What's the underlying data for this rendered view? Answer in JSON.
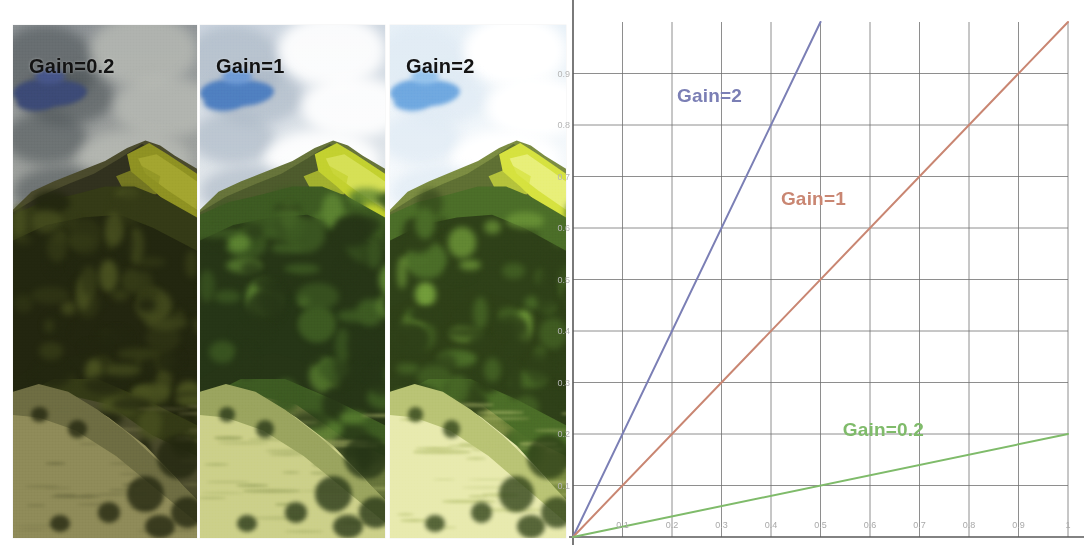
{
  "figure": {
    "background": "#ffffff"
  },
  "panels": [
    {
      "id": "gain-02",
      "label": "Gain=0.2",
      "gain": 0.2,
      "left": 13,
      "top": 25,
      "width": 184,
      "height": 513,
      "brightness": 0.36,
      "saturation": 0.72,
      "contrast": 0.95,
      "sky_top": "#8e9396",
      "sky_bottom": "#a9aba3",
      "cloud_color": "rgba(70,76,80,0.55)",
      "cloud_light": "rgba(186,188,182,0.75)",
      "blue_patch": "#3c4a76",
      "blue_patch_2": "#46558a",
      "ridge_dark": "#31311e",
      "ridge_mid": "#4a4a2c",
      "grass_highlight": "#8e9122",
      "grass_highlight_2": "#a3a52f",
      "forest_dark": "#22260f",
      "forest_mid": "#343a16",
      "forest_light": "#4a5220",
      "slope_top": "#6d6c42",
      "slope_bottom": "#8e8a58",
      "label_color": "#131313"
    },
    {
      "id": "gain-1",
      "label": "Gain=1",
      "gain": 1,
      "left": 200,
      "top": 25,
      "width": 185,
      "height": 513,
      "brightness": 1.0,
      "saturation": 1.0,
      "contrast": 1.0,
      "sky_top": "#cdd6e0",
      "sky_bottom": "#eef1f2",
      "cloud_color": "rgba(168,180,195,0.62)",
      "cloud_light": "rgba(255,255,255,0.9)",
      "blue_patch": "#4f7fc0",
      "blue_patch_2": "#6d9ad6",
      "ridge_dark": "#4d5a2c",
      "ridge_mid": "#66733a",
      "grass_highlight": "#c3d12f",
      "grass_highlight_2": "#d6e055",
      "forest_dark": "#263516",
      "forest_mid": "#3d5a22",
      "forest_light": "#5d8432",
      "slope_top": "#9aa45e",
      "slope_bottom": "#ccd089",
      "label_color": "#121212"
    },
    {
      "id": "gain-2",
      "label": "Gain=2",
      "gain": 2,
      "left": 390,
      "top": 25,
      "width": 176,
      "height": 513,
      "brightness": 1.45,
      "saturation": 1.08,
      "contrast": 1.02,
      "sky_top": "#e8f1f8",
      "sky_bottom": "#ffffff",
      "cloud_color": "rgba(222,234,244,0.7)",
      "cloud_light": "rgba(255,255,255,1)",
      "blue_patch": "#6fa8e0",
      "blue_patch_2": "#93c2ec",
      "ridge_dark": "#5e6f33",
      "ridge_mid": "#7b8c42",
      "grass_highlight": "#d6e23f",
      "grass_highlight_2": "#e8ef78",
      "forest_dark": "#2e4018",
      "forest_mid": "#4b6d28",
      "forest_light": "#75a13c",
      "slope_top": "#b9c374",
      "slope_bottom": "#e8eaae",
      "label_color": "#141414"
    }
  ],
  "chart_data": {
    "type": "line",
    "title": "",
    "xlabel": "",
    "ylabel": "",
    "xlim": [
      0,
      1
    ],
    "ylim": [
      0,
      1
    ],
    "grid": true,
    "grid_color": "#6f6f6f",
    "legend_position": "inline-annotations",
    "x_ticks": [
      "0.1",
      "0.2",
      "0.3",
      "0.4",
      "0.5",
      "0.6",
      "0.7",
      "0.8",
      "0.9",
      "1"
    ],
    "x_tick_values": [
      0.1,
      0.2,
      0.3,
      0.4,
      0.5,
      0.6,
      0.7,
      0.8,
      0.9,
      1.0
    ],
    "y_ticks": [
      "0.1",
      "0.2",
      "0.3",
      "0.4",
      "0.5",
      "0.6",
      "0.7",
      "0.8",
      "0.9"
    ],
    "y_tick_values": [
      0.1,
      0.2,
      0.3,
      0.4,
      0.5,
      0.6,
      0.7,
      0.8,
      0.9
    ],
    "series": [
      {
        "name": "Gain=2",
        "slope": 2,
        "color": "#7b7fb5",
        "x": [
          0,
          0.5
        ],
        "values": [
          0,
          1.0
        ],
        "label": "Gain=2",
        "label_color": "#7b7fb5",
        "label_x": 0.21,
        "label_y": 0.855
      },
      {
        "name": "Gain=1",
        "slope": 1,
        "color": "#c98672",
        "x": [
          0,
          1.0
        ],
        "values": [
          0,
          1.0
        ],
        "label": "Gain=1",
        "label_color": "#c98672",
        "label_x": 0.42,
        "label_y": 0.655
      },
      {
        "name": "Gain=0.2",
        "slope": 0.2,
        "color": "#7fbb6a",
        "x": [
          0,
          1.0
        ],
        "values": [
          0,
          0.2
        ],
        "label": "Gain=0.2",
        "label_color": "#7fbb6a",
        "label_x": 0.545,
        "label_y": 0.205
      }
    ],
    "plot_box": {
      "left": 573,
      "top": 22,
      "right": 1068,
      "bottom": 537
    }
  }
}
